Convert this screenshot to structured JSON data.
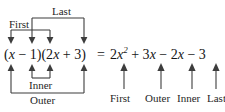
{
  "diagram": {
    "line_color": "#3d3d3d",
    "text_color": "#1a1a1a",
    "background": "#ffffff"
  },
  "equation": {
    "left_factor1": "(x − 1)",
    "left_factor2": "(2x + 3)",
    "left_full": "(x − 1)(2x + 3)",
    "equals": "=",
    "right_full": "2x² + 3x − 2x − 3",
    "right_terms": [
      {
        "text": "2x²",
        "role": "First"
      },
      {
        "text": "+ 3x",
        "role": "Outer"
      },
      {
        "text": "− 2x",
        "role": "Inner"
      },
      {
        "text": "− 3",
        "role": "Last"
      }
    ]
  },
  "top_labels": [
    {
      "text": "First",
      "role": "first-bracket"
    },
    {
      "text": "Last",
      "role": "last-bracket"
    }
  ],
  "bottom_labels": [
    {
      "text": "Inner",
      "role": "inner-bracket"
    },
    {
      "text": "Outer",
      "role": "outer-bracket"
    }
  ],
  "right_labels": [
    {
      "text": "First"
    },
    {
      "text": "Outer"
    },
    {
      "text": "Inner"
    },
    {
      "text": "Last"
    }
  ]
}
